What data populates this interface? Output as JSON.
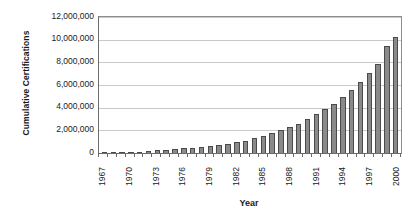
{
  "chart_data": {
    "type": "bar",
    "title": "",
    "xlabel": "Year",
    "ylabel": "Cumulative Certifications",
    "ylim": [
      0,
      12000000
    ],
    "ytick_values": [
      12000000,
      10000000,
      8000000,
      6000000,
      4000000,
      2000000,
      0
    ],
    "ytick_labels": [
      "12,000,000",
      "10,000,000",
      "8,000,000",
      "6,000,000",
      "4,000,000",
      "2,000,000",
      "0"
    ],
    "grid": true,
    "legend": "none",
    "xtick_labels": [
      "1967",
      "1970",
      "1973",
      "1976",
      "1979",
      "1982",
      "1985",
      "1988",
      "1991",
      "1994",
      "1997",
      "2000"
    ],
    "xtick_step": 3,
    "categories": [
      "1967",
      "1968",
      "1969",
      "1970",
      "1971",
      "1972",
      "1973",
      "1974",
      "1975",
      "1976",
      "1977",
      "1978",
      "1979",
      "1980",
      "1981",
      "1982",
      "1983",
      "1984",
      "1985",
      "1986",
      "1987",
      "1988",
      "1989",
      "1990",
      "1991",
      "1992",
      "1993",
      "1994",
      "1995",
      "1996",
      "1997",
      "1998",
      "1999",
      "2000"
    ],
    "values": [
      10000,
      25000,
      50000,
      90000,
      130000,
      180000,
      230000,
      280000,
      340000,
      400000,
      470000,
      550000,
      640000,
      730000,
      830000,
      950000,
      1100000,
      1300000,
      1500000,
      1750000,
      2050000,
      2300000,
      2600000,
      3000000,
      3450000,
      3900000,
      4350000,
      4950000,
      5600000,
      6300000,
      7050000,
      7850000,
      9400000,
      10200000
    ],
    "series_name": "Cumulative Certifications",
    "bar_color": "#8a8a8a",
    "bar_edge_color": "#4a4a4a",
    "grid_color": "#c9c9c9",
    "axis_color": "#6b6b6b",
    "background": "#ffffff"
  }
}
